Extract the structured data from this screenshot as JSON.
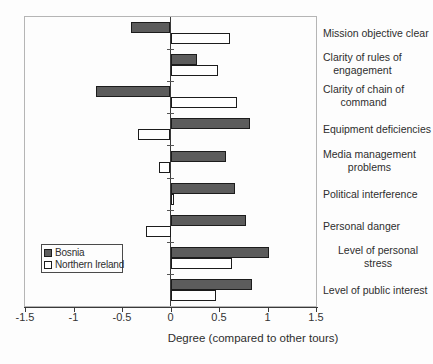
{
  "chart_data": {
    "type": "bar",
    "orientation": "horizontal",
    "title": "",
    "xlabel": "Degree (compared to other tours)",
    "ylabel": "",
    "xlim": [
      -1.5,
      1.5
    ],
    "xticks": [
      -1.5,
      -1,
      -0.5,
      0,
      0.5,
      1,
      1.5
    ],
    "xtick_labels": [
      "-1.5",
      "-1",
      "-0.5",
      "0",
      "0.5",
      "1",
      "1.5"
    ],
    "grid": false,
    "legend_position": "inside-bottom-left",
    "categories": [
      "Mission objective clear",
      "Clarity of rules of engagement",
      "Clarity of chain of command",
      "Equipment deficiencies",
      "Media management problems",
      "Political interference",
      "Personal danger",
      "Level of personal stress",
      "Level of public interest"
    ],
    "category_label_lines": [
      [
        "Mission objective clear"
      ],
      [
        "Clarity of rules of",
        "engagement"
      ],
      [
        "Clarity of chain of",
        "command"
      ],
      [
        "Equipment deficiencies"
      ],
      [
        "Media management",
        "problems"
      ],
      [
        "Political interference"
      ],
      [
        "Personal danger"
      ],
      [
        "Level of personal stress"
      ],
      [
        "Level of public interest"
      ]
    ],
    "series": [
      {
        "name": "Bosnia",
        "color": "#5c5c5c",
        "values": [
          -0.41,
          0.27,
          -0.77,
          0.82,
          0.57,
          0.67,
          0.78,
          1.02,
          0.84
        ]
      },
      {
        "name": "Northern Ireland",
        "color": "#ffffff",
        "values": [
          0.61,
          0.49,
          0.69,
          -0.34,
          -0.12,
          0.04,
          -0.25,
          0.63,
          0.47
        ]
      }
    ],
    "colors": {
      "bar_border": "#1c1c1c",
      "axis": "#3a3a3a",
      "plot_border": "#b5b5b5"
    }
  }
}
